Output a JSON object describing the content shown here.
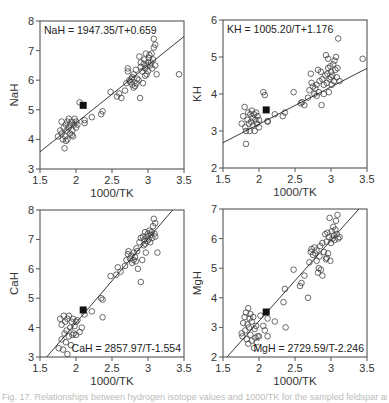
{
  "figure": {
    "caption": "Fig. 17. Relationships between hydrogen isotope values and 1000/TK for the sampled feldspar and hornblende minerals"
  },
  "chart_data": [
    {
      "type": "scatter",
      "id": "nah",
      "equation": "NaH = 1947.35/T+0.659",
      "equation_position": "top-left",
      "xlabel": "1000/TK",
      "ylabel": "NaH",
      "xlim": [
        1.5,
        3.5
      ],
      "ylim": [
        3,
        8
      ],
      "xticks": [
        1.5,
        2,
        2.5,
        3,
        3.5
      ],
      "yticks": [
        3,
        4,
        5,
        6,
        7,
        8
      ],
      "fit": {
        "slope": 1.94735,
        "intercept": 0.659
      },
      "highlight_point": [
        2.1,
        5.15
      ],
      "points": [
        [
          1.75,
          4.1
        ],
        [
          1.78,
          4.3
        ],
        [
          1.8,
          4.2
        ],
        [
          1.8,
          4.6
        ],
        [
          1.82,
          4.0
        ],
        [
          1.83,
          4.4
        ],
        [
          1.84,
          3.7
        ],
        [
          1.85,
          4.1
        ],
        [
          1.86,
          4.5
        ],
        [
          1.87,
          4.3
        ],
        [
          1.88,
          4.0
        ],
        [
          1.88,
          4.6
        ],
        [
          1.9,
          4.4
        ],
        [
          1.9,
          4.7
        ],
        [
          1.92,
          4.2
        ],
        [
          1.92,
          4.5
        ],
        [
          1.94,
          4.6
        ],
        [
          1.95,
          4.3
        ],
        [
          1.96,
          4.1
        ],
        [
          1.97,
          4.5
        ],
        [
          1.98,
          4.7
        ],
        [
          2.0,
          4.6
        ],
        [
          2.0,
          4.4
        ],
        [
          2.02,
          4.5
        ],
        [
          1.86,
          3.95
        ],
        [
          1.94,
          4.15
        ],
        [
          2.05,
          5.25
        ],
        [
          2.12,
          4.55
        ],
        [
          2.12,
          4.65
        ],
        [
          2.22,
          4.75
        ],
        [
          2.35,
          4.85
        ],
        [
          2.37,
          4.95
        ],
        [
          2.48,
          5.6
        ],
        [
          2.57,
          5.45
        ],
        [
          2.6,
          5.55
        ],
        [
          2.63,
          5.4
        ],
        [
          2.68,
          5.65
        ],
        [
          2.7,
          5.9
        ],
        [
          2.72,
          6.3
        ],
        [
          2.72,
          6.4
        ],
        [
          2.74,
          6.0
        ],
        [
          2.75,
          5.95
        ],
        [
          2.77,
          6.05
        ],
        [
          2.78,
          5.85
        ],
        [
          2.78,
          6.1
        ],
        [
          2.8,
          5.75
        ],
        [
          2.8,
          6.2
        ],
        [
          2.82,
          5.8
        ],
        [
          2.83,
          6.35
        ],
        [
          2.84,
          5.9
        ],
        [
          2.85,
          6.05
        ],
        [
          2.87,
          6.0
        ],
        [
          2.88,
          6.8
        ],
        [
          2.89,
          5.4
        ],
        [
          2.9,
          6.45
        ],
        [
          2.9,
          6.6
        ],
        [
          2.92,
          6.3
        ],
        [
          2.93,
          5.9
        ],
        [
          2.94,
          6.55
        ],
        [
          2.95,
          6.7
        ],
        [
          2.96,
          6.4
        ],
        [
          2.97,
          6.9
        ],
        [
          2.98,
          6.2
        ],
        [
          2.98,
          6.5
        ],
        [
          3.0,
          6.6
        ],
        [
          3.0,
          6.3
        ],
        [
          3.01,
          6.75
        ],
        [
          3.02,
          6.85
        ],
        [
          3.03,
          6.5
        ],
        [
          3.04,
          6.6
        ],
        [
          3.05,
          6.9
        ],
        [
          3.06,
          6.4
        ],
        [
          3.07,
          6.7
        ],
        [
          3.08,
          7.1
        ],
        [
          3.08,
          7.4
        ],
        [
          3.1,
          6.5
        ],
        [
          3.1,
          7.2
        ],
        [
          3.12,
          6.2
        ],
        [
          3.43,
          6.2
        ],
        [
          2.96,
          6.15
        ]
      ]
    },
    {
      "type": "scatter",
      "id": "kh",
      "equation": "KH = 1005.20/T+1.176",
      "equation_position": "top-left",
      "xlabel": "1000/TK",
      "ylabel": "KH",
      "xlim": [
        1.5,
        3.5
      ],
      "ylim": [
        2,
        6
      ],
      "xticks": [
        1.5,
        2,
        2.5,
        3,
        3.5
      ],
      "yticks": [
        2,
        3,
        4,
        5,
        6
      ],
      "fit": {
        "slope": 1.0052,
        "intercept": 1.176
      },
      "highlight_point": [
        2.1,
        3.57
      ],
      "points": [
        [
          1.76,
          3.2
        ],
        [
          1.78,
          3.4
        ],
        [
          1.8,
          3.65
        ],
        [
          1.81,
          3.1
        ],
        [
          1.82,
          2.65
        ],
        [
          1.82,
          3.0
        ],
        [
          1.84,
          3.3
        ],
        [
          1.85,
          3.5
        ],
        [
          1.86,
          3.2
        ],
        [
          1.87,
          3.0
        ],
        [
          1.88,
          3.45
        ],
        [
          1.89,
          3.25
        ],
        [
          1.9,
          3.55
        ],
        [
          1.91,
          3.35
        ],
        [
          1.92,
          3.15
        ],
        [
          1.93,
          3.45
        ],
        [
          1.94,
          3.0
        ],
        [
          1.95,
          3.3
        ],
        [
          1.96,
          3.5
        ],
        [
          1.97,
          3.2
        ],
        [
          1.98,
          3.4
        ],
        [
          2.0,
          3.1
        ],
        [
          2.0,
          3.3
        ],
        [
          2.06,
          4.05
        ],
        [
          2.08,
          3.97
        ],
        [
          2.12,
          3.25
        ],
        [
          2.12,
          3.27
        ],
        [
          2.22,
          3.45
        ],
        [
          2.33,
          3.4
        ],
        [
          2.36,
          3.5
        ],
        [
          2.48,
          4.05
        ],
        [
          2.58,
          3.75
        ],
        [
          2.6,
          3.78
        ],
        [
          2.63,
          3.7
        ],
        [
          2.68,
          3.9
        ],
        [
          2.7,
          4.1
        ],
        [
          2.72,
          4.55
        ],
        [
          2.73,
          4.3
        ],
        [
          2.75,
          4.2
        ],
        [
          2.77,
          4.0
        ],
        [
          2.78,
          4.15
        ],
        [
          2.8,
          4.25
        ],
        [
          2.8,
          3.95
        ],
        [
          2.82,
          4.65
        ],
        [
          2.83,
          4.05
        ],
        [
          2.84,
          4.35
        ],
        [
          2.86,
          4.6
        ],
        [
          2.87,
          3.7
        ],
        [
          2.88,
          4.4
        ],
        [
          2.9,
          4.25
        ],
        [
          2.92,
          4.5
        ],
        [
          2.93,
          5.05
        ],
        [
          2.94,
          4.3
        ],
        [
          2.95,
          4.55
        ],
        [
          2.96,
          4.7
        ],
        [
          2.97,
          4.05
        ],
        [
          2.98,
          4.4
        ],
        [
          2.99,
          4.75
        ],
        [
          3.0,
          4.6
        ],
        [
          3.01,
          4.25
        ],
        [
          3.02,
          4.5
        ],
        [
          3.03,
          4.8
        ],
        [
          3.04,
          4.35
        ],
        [
          3.05,
          4.9
        ],
        [
          3.06,
          4.65
        ],
        [
          3.07,
          5.0
        ],
        [
          3.08,
          4.45
        ],
        [
          3.09,
          4.7
        ],
        [
          3.1,
          5.5
        ],
        [
          3.12,
          4.35
        ],
        [
          3.44,
          4.95
        ],
        [
          2.9,
          4.0
        ],
        [
          2.96,
          4.95
        ],
        [
          3.0,
          4.45
        ]
      ]
    },
    {
      "type": "scatter",
      "id": "cah",
      "equation": "CaH = 2857.97/T-1.554",
      "equation_position": "bottom-right",
      "xlabel": "1000/TK",
      "ylabel": "CaH",
      "xlim": [
        1.5,
        3.5
      ],
      "ylim": [
        3,
        8
      ],
      "xticks": [
        1.5,
        2,
        2.5,
        3,
        3.5
      ],
      "yticks": [
        3,
        4,
        5,
        6,
        7,
        8
      ],
      "fit": {
        "slope": 2.85797,
        "intercept": -1.554
      },
      "highlight_point": [
        2.1,
        4.6
      ],
      "points": [
        [
          1.76,
          3.3
        ],
        [
          1.78,
          4.3
        ],
        [
          1.8,
          3.6
        ],
        [
          1.8,
          4.1
        ],
        [
          1.82,
          3.25
        ],
        [
          1.83,
          4.4
        ],
        [
          1.84,
          3.8
        ],
        [
          1.85,
          4.2
        ],
        [
          1.86,
          3.5
        ],
        [
          1.87,
          3.9
        ],
        [
          1.88,
          3.1
        ],
        [
          1.88,
          4.3
        ],
        [
          1.9,
          3.7
        ],
        [
          1.9,
          4.4
        ],
        [
          1.92,
          4.0
        ],
        [
          1.93,
          3.4
        ],
        [
          1.94,
          4.2
        ],
        [
          1.95,
          3.75
        ],
        [
          1.96,
          4.3
        ],
        [
          1.97,
          3.8
        ],
        [
          1.98,
          4.05
        ],
        [
          2.0,
          4.2
        ],
        [
          2.0,
          3.75
        ],
        [
          2.02,
          4.25
        ],
        [
          2.05,
          3.85
        ],
        [
          2.08,
          4.0
        ],
        [
          2.12,
          4.45
        ],
        [
          2.22,
          4.55
        ],
        [
          2.35,
          5.0
        ],
        [
          2.37,
          4.95
        ],
        [
          2.37,
          4.35
        ],
        [
          2.48,
          5.75
        ],
        [
          2.56,
          5.8
        ],
        [
          2.58,
          6.05
        ],
        [
          2.62,
          5.9
        ],
        [
          2.68,
          6.1
        ],
        [
          2.7,
          6.3
        ],
        [
          2.72,
          6.5
        ],
        [
          2.73,
          6.6
        ],
        [
          2.75,
          6.35
        ],
        [
          2.77,
          6.45
        ],
        [
          2.78,
          6.2
        ],
        [
          2.8,
          6.55
        ],
        [
          2.8,
          6.3
        ],
        [
          2.82,
          6.4
        ],
        [
          2.84,
          6.7
        ],
        [
          2.85,
          6.6
        ],
        [
          2.86,
          6.0
        ],
        [
          2.88,
          6.9
        ],
        [
          2.9,
          5.55
        ],
        [
          2.9,
          7.05
        ],
        [
          2.92,
          6.3
        ],
        [
          2.93,
          7.1
        ],
        [
          2.94,
          6.8
        ],
        [
          2.95,
          7.0
        ],
        [
          2.96,
          7.25
        ],
        [
          2.97,
          6.55
        ],
        [
          2.98,
          7.1
        ],
        [
          2.99,
          6.95
        ],
        [
          3.0,
          7.2
        ],
        [
          3.01,
          7.0
        ],
        [
          3.02,
          7.3
        ],
        [
          3.03,
          6.9
        ],
        [
          3.04,
          7.15
        ],
        [
          3.05,
          7.25
        ],
        [
          3.06,
          7.05
        ],
        [
          3.07,
          7.45
        ],
        [
          3.08,
          7.7
        ],
        [
          3.09,
          7.2
        ],
        [
          3.1,
          7.55
        ],
        [
          3.1,
          7.1
        ],
        [
          3.13,
          6.55
        ],
        [
          2.83,
          6.25
        ],
        [
          2.96,
          6.85
        ]
      ]
    },
    {
      "type": "scatter",
      "id": "mgh",
      "equation": "MgH = 2729.59/T-2.246",
      "equation_position": "bottom-right",
      "xlabel": "1000/TK",
      "ylabel": "MgH",
      "xlim": [
        1.5,
        3.5
      ],
      "ylim": [
        2,
        7
      ],
      "xticks": [
        1.5,
        2,
        2.5,
        3,
        3.5
      ],
      "yticks": [
        2,
        3,
        4,
        5,
        6,
        7
      ],
      "fit": {
        "slope": 2.72959,
        "intercept": -2.246
      },
      "highlight_point": [
        2.1,
        3.52
      ],
      "points": [
        [
          1.76,
          2.8
        ],
        [
          1.77,
          2.7
        ],
        [
          1.78,
          3.15
        ],
        [
          1.8,
          3.35
        ],
        [
          1.81,
          2.9
        ],
        [
          1.82,
          3.5
        ],
        [
          1.83,
          2.6
        ],
        [
          1.84,
          3.1
        ],
        [
          1.85,
          3.65
        ],
        [
          1.85,
          2.45
        ],
        [
          1.86,
          3.0
        ],
        [
          1.87,
          3.3
        ],
        [
          1.88,
          2.75
        ],
        [
          1.88,
          3.45
        ],
        [
          1.9,
          3.2
        ],
        [
          1.9,
          2.55
        ],
        [
          1.92,
          3.35
        ],
        [
          1.93,
          2.3
        ],
        [
          1.94,
          2.95
        ],
        [
          1.95,
          2.65
        ],
        [
          1.96,
          3.05
        ],
        [
          1.97,
          2.5
        ],
        [
          1.98,
          2.7
        ],
        [
          2.0,
          2.7
        ],
        [
          2.02,
          3.4
        ],
        [
          2.06,
          3.05
        ],
        [
          2.08,
          2.9
        ],
        [
          2.12,
          2.7
        ],
        [
          2.12,
          3.3
        ],
        [
          2.22,
          3.2
        ],
        [
          2.34,
          3.85
        ],
        [
          2.36,
          4.3
        ],
        [
          2.37,
          3.0
        ],
        [
          2.48,
          4.95
        ],
        [
          2.57,
          4.4
        ],
        [
          2.59,
          4.5
        ],
        [
          2.63,
          4.75
        ],
        [
          2.68,
          4.0
        ],
        [
          2.7,
          5.2
        ],
        [
          2.72,
          5.55
        ],
        [
          2.73,
          5.65
        ],
        [
          2.75,
          5.45
        ],
        [
          2.77,
          5.7
        ],
        [
          2.78,
          5.5
        ],
        [
          2.8,
          5.25
        ],
        [
          2.8,
          5.6
        ],
        [
          2.82,
          4.85
        ],
        [
          2.83,
          5.0
        ],
        [
          2.84,
          5.4
        ],
        [
          2.85,
          5.75
        ],
        [
          2.86,
          4.95
        ],
        [
          2.88,
          4.75
        ],
        [
          2.88,
          5.85
        ],
        [
          2.9,
          5.55
        ],
        [
          2.92,
          6.15
        ],
        [
          2.93,
          5.3
        ],
        [
          2.94,
          5.9
        ],
        [
          2.95,
          6.2
        ],
        [
          2.96,
          5.5
        ],
        [
          2.97,
          6.05
        ],
        [
          2.98,
          6.7
        ],
        [
          2.99,
          5.25
        ],
        [
          3.0,
          5.85
        ],
        [
          3.01,
          6.25
        ],
        [
          3.02,
          6.0
        ],
        [
          3.03,
          6.4
        ],
        [
          3.04,
          6.1
        ],
        [
          3.05,
          5.95
        ],
        [
          3.06,
          6.3
        ],
        [
          3.07,
          6.6
        ],
        [
          3.08,
          6.15
        ],
        [
          3.09,
          6.8
        ],
        [
          3.1,
          6.0
        ],
        [
          3.12,
          6.05
        ],
        [
          2.94,
          5.35
        ]
      ]
    }
  ]
}
